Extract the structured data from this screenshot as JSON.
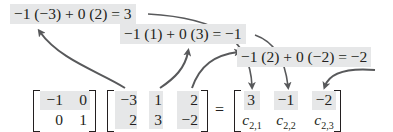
{
  "equations": [
    {
      "text": "−1 (−3) + 0 (2) = 3"
    },
    {
      "text": "−1 (1) + 0 (3) = −1"
    },
    {
      "text": "−1 (2) + 0 (−2) = −2"
    }
  ],
  "matrix_a": {
    "rows": [
      [
        "−1",
        "0"
      ],
      [
        "0",
        "1"
      ]
    ],
    "highlighted_row": 0
  },
  "matrix_b": {
    "rows": [
      [
        "−3",
        "1",
        "2"
      ],
      [
        "2",
        "3",
        "−2"
      ]
    ],
    "highlighted_columns": [
      0,
      1,
      2
    ]
  },
  "equals_sign": "=",
  "matrix_c": {
    "row1": [
      "3",
      "−1",
      "−2"
    ],
    "row2": [
      {
        "base": "c",
        "sub": "2,1"
      },
      {
        "base": "c",
        "sub": "2,2"
      },
      {
        "base": "c",
        "sub": "2,3"
      }
    ]
  },
  "colors": {
    "highlight": "#e6e7e8",
    "arrow": "#58595b",
    "text": "#231f20"
  }
}
